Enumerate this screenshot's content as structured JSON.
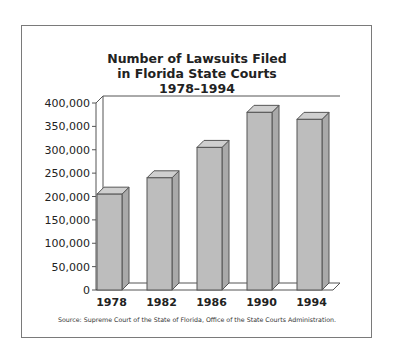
{
  "title_lines": [
    "Number of Lawsuits Filed",
    "in Florida State Courts",
    "1978–1994"
  ],
  "source": "Source: Supreme Court of the State of Florida, Office of the State Courts Administration.",
  "colors": {
    "bar_front": "#bdbdbd",
    "bar_side": "#a9a9a9",
    "bar_top": "#cfcfcf",
    "outline": "#555555",
    "frame": "#7a7a7a"
  },
  "chart_data": {
    "type": "bar",
    "title": "Number of Lawsuits Filed in Florida State Courts 1978–1994",
    "categories": [
      "1978",
      "1982",
      "1986",
      "1990",
      "1994"
    ],
    "values": [
      205000,
      240000,
      305000,
      380000,
      365000
    ],
    "xlabel": "",
    "ylabel": "",
    "ylim": [
      0,
      400000
    ],
    "yticks": [
      0,
      50000,
      100000,
      150000,
      200000,
      250000,
      300000,
      350000,
      400000
    ],
    "ytick_labels": [
      "0",
      "50,000",
      "100,000",
      "150,000",
      "200,000",
      "250,000",
      "300,000",
      "350,000",
      "400,000"
    ],
    "grid": false,
    "legend": null,
    "style": "3d-bar",
    "annotations": [
      "Source: Supreme Court of the State of Florida, Office of the State Courts Administration."
    ]
  }
}
